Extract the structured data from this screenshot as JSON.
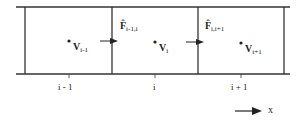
{
  "cells": [
    {
      "label": "i - 1",
      "value_sym": "V",
      "value_sub": "i-1"
    },
    {
      "label": "i",
      "value_sym": "V",
      "value_sub": "i"
    },
    {
      "label": "i + 1",
      "value_sym": "V",
      "value_sub": "i+1"
    }
  ],
  "fluxes": [
    {
      "sym": "F̂",
      "sub": "i-1,i"
    },
    {
      "sym": "F̂",
      "sub": "i,i+1"
    }
  ],
  "axis": {
    "label": "x"
  },
  "colors": {
    "line": "#333333",
    "background": "#ffffff"
  }
}
